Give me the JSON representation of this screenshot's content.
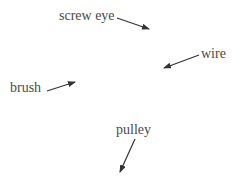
{
  "diagram": {
    "callouts": [
      {
        "id": "screw-eye",
        "label": "screw eye"
      },
      {
        "id": "wire",
        "label": "wire"
      },
      {
        "id": "brush",
        "label": "brush"
      },
      {
        "id": "pulley",
        "label": "pulley"
      }
    ],
    "colors": {
      "text": "#4a4a4a",
      "arrow": "#333333",
      "background": "#ffffff"
    }
  }
}
